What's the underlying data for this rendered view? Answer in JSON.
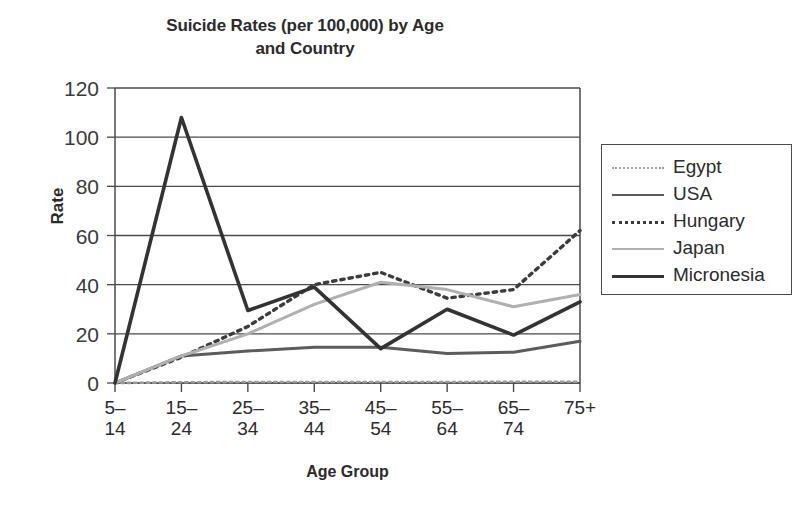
{
  "chart_data": {
    "type": "line",
    "title": "Suicide Rates (per 100,000) by Age and Country",
    "title_line1": "Suicide Rates (per 100,000) by Age",
    "title_line2": "and Country",
    "xlabel": "Age Group",
    "ylabel": "Rate",
    "categories": [
      "5–14",
      "15–24",
      "25–34",
      "35–44",
      "45–54",
      "55–64",
      "65–74",
      "75+"
    ],
    "category_lines": [
      [
        "5–",
        "14"
      ],
      [
        "15–",
        "24"
      ],
      [
        "25–",
        "34"
      ],
      [
        "35–",
        "44"
      ],
      [
        "45–",
        "54"
      ],
      [
        "55–",
        "64"
      ],
      [
        "65–",
        "74"
      ],
      [
        "75+",
        ""
      ]
    ],
    "ylim": [
      0,
      120
    ],
    "yticks": [
      0,
      20,
      40,
      60,
      80,
      100,
      120
    ],
    "grid": true,
    "grid_axis": "y",
    "legend_position": "right",
    "series": [
      {
        "name": "Egypt",
        "values": [
          0,
          0.3,
          0.4,
          0.4,
          0.4,
          0.4,
          0.5,
          0.5
        ],
        "color": "#9a9a9a",
        "style": "dotted",
        "width": 2.6
      },
      {
        "name": "USA",
        "values": [
          0,
          11,
          13,
          14.5,
          14.5,
          12,
          12.5,
          17
        ],
        "color": "#5c5c5c",
        "style": "solid",
        "width": 3.0
      },
      {
        "name": "Hungary",
        "values": [
          0,
          10.5,
          23,
          40,
          45,
          34.5,
          38,
          62
        ],
        "color": "#3c3c3c",
        "style": "dotted",
        "width": 3.4
      },
      {
        "name": "Japan",
        "values": [
          0,
          11,
          20,
          32,
          41,
          38,
          31,
          36
        ],
        "color": "#b0b0b0",
        "style": "solid",
        "width": 3.0
      },
      {
        "name": "Micronesia",
        "values": [
          0,
          108,
          29.5,
          39,
          14,
          30,
          19.5,
          33
        ],
        "color": "#333333",
        "style": "solid",
        "width": 3.6
      }
    ]
  },
  "axes": {
    "y_tick_labels": [
      "0",
      "20",
      "40",
      "60",
      "80",
      "100",
      "120"
    ]
  },
  "legend": {
    "entries": [
      {
        "label": "Egypt"
      },
      {
        "label": "USA"
      },
      {
        "label": "Hungary"
      },
      {
        "label": "Japan"
      },
      {
        "label": "Micronesia"
      }
    ]
  }
}
